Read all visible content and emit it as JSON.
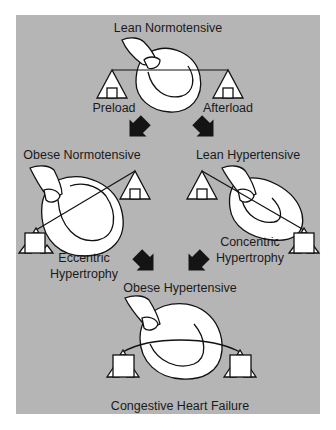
{
  "figure": {
    "background": "#ffffff",
    "panel_color": "#b5b5b5",
    "stage_top": {
      "title": "Lean Normotensive",
      "left_label": "Preload",
      "right_label": "Afterload"
    },
    "stage_left": {
      "title": "Obese Normotensive",
      "caption_line1": "Eccentric",
      "caption_line2": "Hypertrophy"
    },
    "stage_right": {
      "title": "Lean Hypertensive",
      "caption_line1": "Concentric",
      "caption_line2": "Hypertrophy"
    },
    "stage_bottom": {
      "title": "Obese Hypertensive",
      "caption": "Congestive Heart Failure"
    },
    "arrows": [
      {
        "from": "Lean Normotensive",
        "to": "Obese Normotensive",
        "direction": "down-left"
      },
      {
        "from": "Lean Normotensive",
        "to": "Lean Hypertensive",
        "direction": "down-right"
      },
      {
        "from": "Obese Normotensive",
        "to": "Obese Hypertensive",
        "direction": "down-right"
      },
      {
        "from": "Lean Hypertensive",
        "to": "Obese Hypertensive",
        "direction": "down-left"
      }
    ],
    "icons": [
      "heart-icon",
      "balance-beam-icon",
      "fulcrum-triangle-icon",
      "weight-box-icon",
      "block-arrow-icon"
    ]
  }
}
